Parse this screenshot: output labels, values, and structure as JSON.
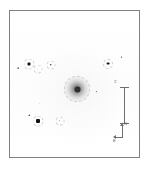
{
  "view": {
    "title": "astronomical-field-image",
    "background_color": "#ffffff",
    "frame_color": "#808080",
    "colormap": "inverted-grayscale"
  },
  "objects": {
    "galaxy": {
      "name": "central-galaxy",
      "x_pct": 52.0,
      "y_pct": 53.5,
      "size_px": 27,
      "core_color": "#2e2e2e"
    },
    "stars": [
      {
        "x_pct": 6.5,
        "y_pct": 39.0,
        "size": 1.8,
        "shape": "round"
      },
      {
        "x_pct": 14.5,
        "y_pct": 36.5,
        "size": 3.0,
        "shape": "square"
      },
      {
        "x_pct": 21.5,
        "y_pct": 39.5,
        "size": 1.4,
        "shape": "round"
      },
      {
        "x_pct": 31.5,
        "y_pct": 37.0,
        "size": 2.4,
        "shape": "round"
      },
      {
        "x_pct": 76.0,
        "y_pct": 36.0,
        "size": 2.8,
        "shape": "square"
      },
      {
        "x_pct": 86.5,
        "y_pct": 31.5,
        "size": 1.8,
        "shape": "round"
      },
      {
        "x_pct": 67.0,
        "y_pct": 55.5,
        "size": 1.4,
        "shape": "round"
      },
      {
        "x_pct": 44.0,
        "y_pct": 63.0,
        "size": 1.2,
        "shape": "round"
      },
      {
        "x_pct": 57.0,
        "y_pct": 63.5,
        "size": 1.2,
        "shape": "round"
      },
      {
        "x_pct": 23.0,
        "y_pct": 63.5,
        "size": 1.4,
        "shape": "round"
      },
      {
        "x_pct": 15.0,
        "y_pct": 71.5,
        "size": 1.6,
        "shape": "round"
      },
      {
        "x_pct": 22.0,
        "y_pct": 75.0,
        "size": 4.0,
        "shape": "square"
      },
      {
        "x_pct": 38.5,
        "y_pct": 75.0,
        "size": 1.6,
        "shape": "round"
      },
      {
        "x_pct": 34.0,
        "y_pct": 79.5,
        "size": 1.1,
        "shape": "round"
      },
      {
        "x_pct": 2.5,
        "y_pct": 46.0,
        "size": 1.0,
        "shape": "round"
      }
    ],
    "annotation_circles": [
      {
        "x_pct": 14.5,
        "y_pct": 36.5,
        "size": 11
      },
      {
        "x_pct": 21.5,
        "y_pct": 39.5,
        "size": 9
      },
      {
        "x_pct": 31.5,
        "y_pct": 37.0,
        "size": 9
      },
      {
        "x_pct": 76.0,
        "y_pct": 36.0,
        "size": 10
      },
      {
        "x_pct": 22.0,
        "y_pct": 75.0,
        "size": 11
      },
      {
        "x_pct": 38.5,
        "y_pct": 75.0,
        "size": 9
      },
      {
        "x_pct": 52.0,
        "y_pct": 53.5,
        "size": 26
      }
    ]
  },
  "scalebar": {
    "name": "scale-bar",
    "label": "1'",
    "color": "#6e6e6e"
  },
  "compass": {
    "name": "orientation-compass",
    "north_label": "N",
    "east_label": "E",
    "color": "#6e6e6e"
  }
}
